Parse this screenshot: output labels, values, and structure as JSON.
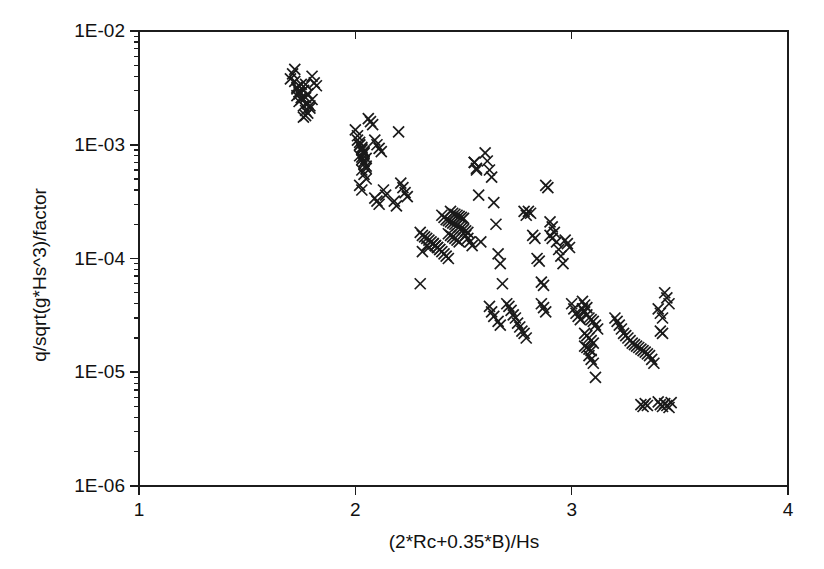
{
  "chart_data": {
    "type": "scatter",
    "title": "",
    "xlabel": "(2*Rc+0.35*B)/Hs",
    "ylabel": "q/sqrt(g*Hs^3)/factor",
    "xscale": "linear",
    "yscale": "log",
    "xlim": [
      1,
      4
    ],
    "ylim": [
      1e-06,
      0.01
    ],
    "grid": false,
    "legend": null,
    "marker": "x",
    "marker_color": "#1a1a1a",
    "xticks": [
      1,
      2,
      3,
      4
    ],
    "xticklabels": [
      "1",
      "2",
      "3",
      "4"
    ],
    "yticks": [
      1e-06,
      1e-05,
      0.0001,
      0.001,
      0.01
    ],
    "yticklabels": [
      "1E-06",
      "1E-05",
      "1E-04",
      "1E-03",
      "1E-02"
    ],
    "minor_ticks": {
      "x": false,
      "y": true
    },
    "series": [
      {
        "name": "overtopping data",
        "x": [
          1.7,
          1.71,
          1.72,
          1.73,
          1.74,
          1.75,
          1.76,
          1.77,
          1.78,
          1.79,
          1.72,
          1.73,
          1.74,
          1.75,
          1.76,
          1.77,
          1.78,
          1.8,
          1.81,
          1.82,
          1.73,
          1.74,
          1.75,
          1.76,
          1.77,
          1.78,
          1.79,
          1.8,
          1.76,
          1.77,
          2.0,
          2.01,
          2.02,
          2.03,
          2.04,
          2.02,
          2.03,
          2.04,
          2.05,
          2.01,
          2.02,
          2.03,
          2.04,
          2.03,
          2.04,
          2.05,
          2.02,
          2.03,
          2.04,
          2.05,
          2.03,
          2.04,
          2.05,
          2.02,
          2.03,
          2.06,
          2.07,
          2.08,
          2.09,
          2.1,
          2.11,
          2.12,
          2.09,
          2.1,
          2.11,
          2.2,
          2.21,
          2.22,
          2.23,
          2.24,
          2.3,
          2.31,
          2.32,
          2.33,
          2.34,
          2.35,
          2.36,
          2.37,
          2.38,
          2.39,
          2.4,
          2.41,
          2.42,
          2.43,
          2.44,
          2.45,
          2.46,
          2.47,
          2.48,
          2.49,
          2.5,
          2.51,
          2.52,
          2.44,
          2.45,
          2.46,
          2.47,
          2.48,
          2.49,
          2.5,
          2.51,
          2.52,
          2.53,
          2.54,
          2.43,
          2.44,
          2.45,
          2.46,
          2.47,
          2.48,
          2.36,
          2.37,
          2.38,
          2.39,
          2.4,
          2.41,
          2.42,
          2.43,
          2.33,
          2.34,
          2.3,
          2.31,
          2.55,
          2.56,
          2.57,
          2.58,
          2.6,
          2.61,
          2.62,
          2.63,
          2.64,
          2.65,
          2.66,
          2.67,
          2.68,
          2.7,
          2.71,
          2.72,
          2.73,
          2.74,
          2.75,
          2.76,
          2.77,
          2.78,
          2.79,
          2.8,
          2.81,
          2.82,
          2.83,
          2.84,
          2.85,
          2.86,
          2.87,
          2.88,
          2.89,
          2.9,
          2.91,
          2.92,
          2.93,
          2.94,
          2.95,
          2.96,
          2.97,
          2.98,
          2.99,
          3.0,
          3.01,
          3.02,
          3.03,
          3.04,
          3.05,
          3.06,
          3.07,
          3.08,
          3.09,
          3.1,
          3.11,
          3.12,
          3.06,
          3.07,
          3.08,
          3.09,
          3.1,
          3.06,
          3.07,
          3.08,
          3.09,
          3.05,
          3.06,
          3.07,
          3.08,
          3.09,
          3.1,
          3.11,
          3.2,
          3.21,
          3.22,
          3.23,
          3.24,
          3.25,
          3.26,
          3.27,
          3.28,
          3.29,
          3.3,
          3.31,
          3.32,
          3.33,
          3.34,
          3.35,
          3.36,
          3.37,
          3.38,
          3.4,
          3.41,
          3.42,
          3.43,
          3.44,
          3.45,
          3.46
        ],
        "y": [
          0.0038,
          0.0042,
          0.0046,
          0.0032,
          0.0029,
          0.0034,
          0.003,
          0.0026,
          0.0023,
          0.0021,
          0.0036,
          0.0031,
          0.0028,
          0.0025,
          0.0022,
          0.002,
          0.0019,
          0.004,
          0.0035,
          0.0033,
          0.0027,
          0.0024,
          0.0026,
          0.003,
          0.0034,
          0.0028,
          0.0022,
          0.0025,
          0.00175,
          0.0018,
          0.00135,
          0.0012,
          0.00105,
          0.00095,
          0.00088,
          0.0008,
          0.00074,
          0.00068,
          0.00062,
          0.0011,
          0.00099,
          0.0009,
          0.00084,
          0.00078,
          0.00071,
          0.00065,
          0.001,
          0.00092,
          0.00086,
          0.00076,
          0.0006,
          0.00055,
          0.0005,
          0.00044,
          0.0004,
          0.0017,
          0.0016,
          0.0015,
          0.0011,
          0.001,
          0.00093,
          0.00087,
          0.00034,
          0.00032,
          0.0003,
          0.0013,
          0.00046,
          0.00042,
          0.00038,
          0.00035,
          0.00017,
          0.00016,
          0.000155,
          0.00015,
          0.000145,
          0.00014,
          0.000135,
          0.00013,
          0.000125,
          0.00012,
          0.00024,
          0.00023,
          0.00022,
          0.000215,
          0.00021,
          0.000205,
          0.0002,
          0.000195,
          0.00019,
          0.000185,
          0.00018,
          0.000175,
          0.00017,
          0.00026,
          0.00025,
          0.000245,
          0.00024,
          0.000235,
          0.00023,
          0.000225,
          0.00016,
          0.00015,
          0.00014,
          0.00013,
          0.000165,
          0.00016,
          0.000155,
          0.00015,
          0.000145,
          0.00014,
          0.000135,
          0.00013,
          0.000125,
          0.00012,
          0.000115,
          0.00011,
          0.000105,
          0.0001,
          0.00013,
          0.000125,
          6e-05,
          0.000115,
          0.0007,
          0.00062,
          0.00036,
          0.00014,
          0.00085,
          0.00072,
          0.0006,
          0.00052,
          0.00031,
          0.0002,
          0.00011,
          9e-05,
          6e-05,
          4e-05,
          3.8e-05,
          3.5e-05,
          3.2e-05,
          3e-05,
          2.7e-05,
          2.5e-05,
          2.3e-05,
          2.2e-05,
          2e-05,
          0.00026,
          0.00025,
          0.00016,
          0.00015,
          0.0001,
          9.5e-05,
          6.2e-05,
          5.8e-05,
          0.00044,
          0.00042,
          0.00021,
          0.00019,
          0.00017,
          0.00014,
          0.00012,
          0.000105,
          9e-05,
          0.000145,
          0.000135,
          0.000125,
          4e-05,
          3.6e-05,
          3.3e-05,
          3.1e-05,
          2.9e-05,
          3.6e-05,
          3.4e-05,
          3.2e-05,
          3e-05,
          2.9e-05,
          2.8e-05,
          2.6e-05,
          2.4e-05,
          2.2e-05,
          2.1e-05,
          2e-05,
          1.9e-05,
          1.8e-05,
          1.7e-05,
          1.65e-05,
          1.6e-05,
          1.55e-05,
          4.2e-05,
          3.9e-05,
          3.7e-05,
          1.4e-05,
          1.3e-05,
          1.2e-05,
          9e-06,
          3e-05,
          2.8e-05,
          2.6e-05,
          2.4e-05,
          2.2e-05,
          2.1e-05,
          2e-05,
          1.9e-05,
          1.8e-05,
          1.75e-05,
          1.7e-05,
          1.65e-05,
          1.6e-05,
          1.55e-05,
          1.5e-05,
          1.45e-05,
          1.4e-05,
          1.3e-05,
          1.2e-05,
          5.5e-06,
          5.2e-06,
          5e-06,
          5.3e-06,
          5.1e-06,
          4.9e-06,
          5.4e-06
        ]
      }
    ],
    "extra_points": {
      "x": [
        2.13,
        2.14,
        2.18,
        2.19,
        2.55,
        2.56,
        2.78,
        2.79,
        2.9,
        2.91,
        3.32,
        3.33,
        3.34,
        3.35,
        3.41,
        3.42,
        3.43,
        3.44,
        3.45,
        3.4,
        3.41,
        3.42,
        2.62,
        2.63,
        2.64,
        2.86,
        2.87,
        2.88,
        2.66,
        2.67
      ],
      "y": [
        0.0004,
        0.00036,
        0.00032,
        0.00029,
        0.0007,
        0.0006,
        0.00026,
        0.00024,
        0.00016,
        0.00015,
        5.2e-06,
        5e-06,
        5.3e-06,
        5.1e-06,
        2.3e-05,
        2.2e-05,
        5e-05,
        4.5e-05,
        4e-05,
        3.6e-05,
        3.3e-05,
        3e-05,
        3.8e-05,
        3.4e-05,
        3.1e-05,
        4e-05,
        3.7e-05,
        3.4e-05,
        2.8e-05,
        2.6e-05
      ]
    }
  },
  "axes": {
    "x_label": "(2*Rc+0.35*B)/Hs",
    "y_label": "q/sqrt(g*Hs^3)/factor"
  }
}
